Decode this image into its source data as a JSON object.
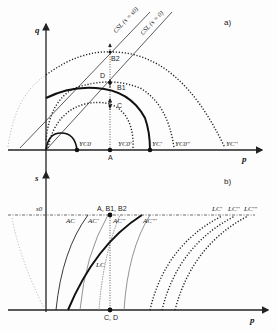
{
  "panel_a": {
    "tag": "a)",
    "y_axis_label": "q",
    "x_axis_label": "p",
    "csl_labels": [
      "CSL (s = s0)",
      "CSL (s = 0)"
    ],
    "curve_labels": {
      "yc0": "YC0",
      "yc0_prime": "YC0'",
      "yc_prime": "YC'",
      "yc0_double": "YC0''",
      "yc_double": "YC''"
    },
    "points": {
      "a": "A",
      "b1": "B1",
      "b2": "B2",
      "c": "C",
      "d": "D"
    }
  },
  "panel_b": {
    "tag": "b)",
    "y_axis_label": "s",
    "x_axis_label": "p",
    "s0_label": "s0",
    "top_point_label": "A, B1, B2",
    "bottom_point_label": "C, D",
    "curve_labels": {
      "ac": "AC",
      "ac1": "AC'",
      "ac2": "AC''",
      "ac3": "AC'''",
      "lc": "LC",
      "lc1": "LC'",
      "lc2": "LC''",
      "lc3": "LC'''"
    }
  }
}
